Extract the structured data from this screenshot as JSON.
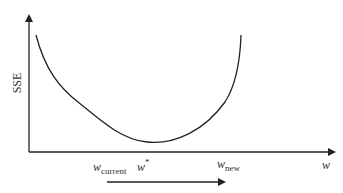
{
  "diagram": {
    "y_axis_label": "SSE",
    "x_axis_label": "w",
    "labels": {
      "w_current": {
        "base": "w",
        "sub": "current"
      },
      "w_star": {
        "base": "w",
        "sup": "*"
      },
      "w_new": {
        "base": "w",
        "sub": "new"
      }
    },
    "colors": {
      "line": "#222222",
      "text": "#333333",
      "background": "#ffffff"
    }
  }
}
